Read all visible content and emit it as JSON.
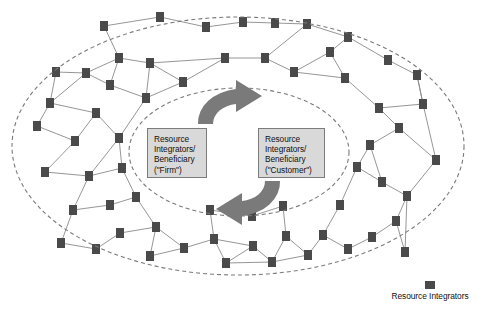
{
  "figure": {
    "type": "network-diagram",
    "background_color": "#ffffff"
  },
  "center_boxes": [
    {
      "id": "firm",
      "text": "Resource\nIntegrators/\nBeneficiary\n(\"Firm\")",
      "fill_color": "#d9d9d9",
      "border_color": "#7c7c7c"
    },
    {
      "id": "customer",
      "text": "Resource\nIntegrators/\nBeneficiary\n(\"Customer\")",
      "fill_color": "#d9d9d9",
      "border_color": "#7c7c7c"
    }
  ],
  "legend": {
    "swatch_name": "resource-integrator-node-swatch",
    "swatch_color": "#4a4a4a",
    "label": "Resource Integrators"
  },
  "cycle_arrows": {
    "name": "service-exchange-cycle",
    "color": "#7a7a7a",
    "top_arrow_direction": "clockwise-right",
    "bottom_arrow_direction": "clockwise-left"
  },
  "boundaries": [
    {
      "name": "outer-ecosystem-boundary",
      "style": "dashed",
      "cx": 238,
      "cy": 146,
      "rx": 226,
      "ry": 129,
      "color": "#7a7a7a"
    },
    {
      "name": "inner-service-ecosystem-boundary",
      "style": "dashed",
      "cx": 239,
      "cy": 152,
      "rx": 110,
      "ry": 64,
      "color": "#7a7a7a"
    }
  ],
  "chart_data": {
    "type": "scatter",
    "title": "",
    "xlabel": "",
    "ylabel": "",
    "node_color": "#4a4a4a",
    "edge_color": "#8a8a8a",
    "node_width": 8,
    "node_height": 10,
    "nodes": [
      {
        "id": 0,
        "x": 104,
        "y": 26
      },
      {
        "id": 1,
        "x": 160,
        "y": 17
      },
      {
        "id": 2,
        "x": 206,
        "y": 27
      },
      {
        "id": 3,
        "x": 243,
        "y": 22
      },
      {
        "id": 4,
        "x": 275,
        "y": 23
      },
      {
        "id": 5,
        "x": 307,
        "y": 24
      },
      {
        "id": 6,
        "x": 348,
        "y": 37
      },
      {
        "id": 7,
        "x": 119,
        "y": 58
      },
      {
        "id": 8,
        "x": 86,
        "y": 73
      },
      {
        "id": 9,
        "x": 150,
        "y": 63
      },
      {
        "id": 10,
        "x": 146,
        "y": 98
      },
      {
        "id": 11,
        "x": 183,
        "y": 82
      },
      {
        "id": 12,
        "x": 225,
        "y": 58
      },
      {
        "id": 13,
        "x": 265,
        "y": 58
      },
      {
        "id": 14,
        "x": 294,
        "y": 72
      },
      {
        "id": 15,
        "x": 330,
        "y": 52
      },
      {
        "id": 16,
        "x": 345,
        "y": 78
      },
      {
        "id": 17,
        "x": 56,
        "y": 72
      },
      {
        "id": 18,
        "x": 50,
        "y": 103
      },
      {
        "id": 19,
        "x": 37,
        "y": 126
      },
      {
        "id": 20,
        "x": 96,
        "y": 113
      },
      {
        "id": 21,
        "x": 75,
        "y": 141
      },
      {
        "id": 22,
        "x": 119,
        "y": 138
      },
      {
        "id": 23,
        "x": 45,
        "y": 172
      },
      {
        "id": 24,
        "x": 89,
        "y": 176
      },
      {
        "id": 25,
        "x": 122,
        "y": 168
      },
      {
        "id": 26,
        "x": 73,
        "y": 210
      },
      {
        "id": 27,
        "x": 110,
        "y": 205
      },
      {
        "id": 28,
        "x": 136,
        "y": 197
      },
      {
        "id": 29,
        "x": 120,
        "y": 233
      },
      {
        "id": 30,
        "x": 156,
        "y": 227
      },
      {
        "id": 31,
        "x": 150,
        "y": 256
      },
      {
        "id": 32,
        "x": 184,
        "y": 248
      },
      {
        "id": 33,
        "x": 214,
        "y": 239
      },
      {
        "id": 34,
        "x": 226,
        "y": 263
      },
      {
        "id": 35,
        "x": 253,
        "y": 246
      },
      {
        "id": 36,
        "x": 272,
        "y": 262
      },
      {
        "id": 37,
        "x": 286,
        "y": 236
      },
      {
        "id": 38,
        "x": 308,
        "y": 255
      },
      {
        "id": 39,
        "x": 323,
        "y": 235
      },
      {
        "id": 40,
        "x": 348,
        "y": 249
      },
      {
        "id": 41,
        "x": 372,
        "y": 237
      },
      {
        "id": 42,
        "x": 396,
        "y": 221
      },
      {
        "id": 43,
        "x": 407,
        "y": 196
      },
      {
        "id": 44,
        "x": 382,
        "y": 182
      },
      {
        "id": 45,
        "x": 357,
        "y": 167
      },
      {
        "id": 46,
        "x": 370,
        "y": 145
      },
      {
        "id": 47,
        "x": 399,
        "y": 128
      },
      {
        "id": 48,
        "x": 379,
        "y": 108
      },
      {
        "id": 49,
        "x": 423,
        "y": 104
      },
      {
        "id": 50,
        "x": 417,
        "y": 75
      },
      {
        "id": 51,
        "x": 388,
        "y": 60
      },
      {
        "id": 52,
        "x": 61,
        "y": 243
      },
      {
        "id": 53,
        "x": 96,
        "y": 249
      },
      {
        "id": 54,
        "x": 210,
        "y": 210
      },
      {
        "id": 55,
        "x": 252,
        "y": 216
      },
      {
        "id": 56,
        "x": 283,
        "y": 206
      },
      {
        "id": 57,
        "x": 340,
        "y": 205
      },
      {
        "id": 58,
        "x": 405,
        "y": 252
      },
      {
        "id": 59,
        "x": 436,
        "y": 160
      },
      {
        "id": 60,
        "x": 110,
        "y": 85
      }
    ],
    "edges": [
      [
        0,
        1
      ],
      [
        0,
        7
      ],
      [
        1,
        2
      ],
      [
        2,
        3
      ],
      [
        3,
        4
      ],
      [
        4,
        5
      ],
      [
        5,
        6
      ],
      [
        5,
        13
      ],
      [
        7,
        9
      ],
      [
        7,
        8
      ],
      [
        7,
        60
      ],
      [
        8,
        17
      ],
      [
        8,
        18
      ],
      [
        9,
        11
      ],
      [
        9,
        12
      ],
      [
        10,
        11
      ],
      [
        10,
        60
      ],
      [
        11,
        12
      ],
      [
        12,
        13
      ],
      [
        13,
        14
      ],
      [
        14,
        15
      ],
      [
        14,
        16
      ],
      [
        15,
        16
      ],
      [
        15,
        6
      ],
      [
        17,
        18
      ],
      [
        18,
        19
      ],
      [
        18,
        20
      ],
      [
        19,
        21
      ],
      [
        20,
        21
      ],
      [
        20,
        22
      ],
      [
        21,
        23
      ],
      [
        22,
        25
      ],
      [
        23,
        24
      ],
      [
        24,
        25
      ],
      [
        24,
        26
      ],
      [
        25,
        28
      ],
      [
        26,
        27
      ],
      [
        27,
        28
      ],
      [
        26,
        52
      ],
      [
        52,
        53
      ],
      [
        53,
        29
      ],
      [
        29,
        30
      ],
      [
        30,
        31
      ],
      [
        31,
        32
      ],
      [
        32,
        33
      ],
      [
        33,
        34
      ],
      [
        33,
        35
      ],
      [
        34,
        35
      ],
      [
        35,
        36
      ],
      [
        36,
        37
      ],
      [
        37,
        38
      ],
      [
        38,
        39
      ],
      [
        39,
        40
      ],
      [
        40,
        41
      ],
      [
        41,
        42
      ],
      [
        42,
        43
      ],
      [
        43,
        44
      ],
      [
        44,
        45
      ],
      [
        45,
        46
      ],
      [
        46,
        47
      ],
      [
        47,
        48
      ],
      [
        48,
        49
      ],
      [
        49,
        50
      ],
      [
        50,
        51
      ],
      [
        51,
        6
      ],
      [
        47,
        59
      ],
      [
        42,
        58
      ],
      [
        58,
        43
      ],
      [
        33,
        54
      ],
      [
        54,
        55
      ],
      [
        55,
        56
      ],
      [
        37,
        56
      ],
      [
        57,
        45
      ],
      [
        39,
        57
      ],
      [
        28,
        30
      ],
      [
        22,
        24
      ],
      [
        10,
        22
      ],
      [
        60,
        8
      ],
      [
        16,
        48
      ],
      [
        44,
        46
      ],
      [
        50,
        49
      ],
      [
        30,
        32
      ],
      [
        36,
        38
      ],
      [
        34,
        36
      ],
      [
        59,
        43
      ],
      [
        49,
        59
      ],
      [
        9,
        10
      ]
    ]
  }
}
